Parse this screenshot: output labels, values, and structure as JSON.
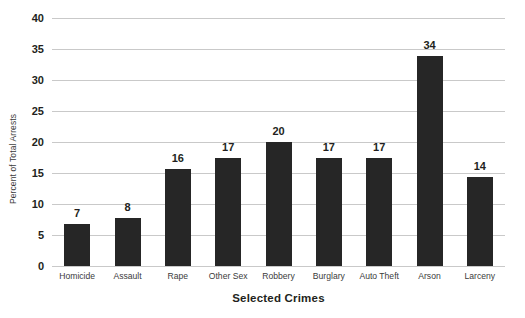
{
  "chart_data": {
    "type": "bar",
    "title": "",
    "xlabel": "Selected Crimes",
    "ylabel": "Percent of Total Arrests",
    "categories": [
      "Homicide",
      "Assault",
      "Rape",
      "Other Sex",
      "Robbery",
      "Burglary",
      "Auto Theft",
      "Arson",
      "Larceny"
    ],
    "values": [
      7,
      8,
      16,
      17,
      20,
      17,
      17,
      34,
      14
    ],
    "plotted_values": [
      6.7,
      7.8,
      15.6,
      17.4,
      20.0,
      17.4,
      17.4,
      33.8,
      14.3
    ],
    "ylim": [
      0,
      40
    ],
    "yticks": [
      0,
      5,
      10,
      15,
      20,
      25,
      30,
      35,
      40
    ],
    "ytick_labels": [
      "0",
      "5",
      "10",
      "15",
      "20",
      "25",
      "30",
      "35",
      "40"
    ],
    "grid": "horizontal",
    "legend": "none",
    "bar_color": "#262626",
    "gridline_color": "#c9c9c9",
    "background_color": "#ffffff",
    "data_labels": [
      "7",
      "8",
      "16",
      "17",
      "20",
      "17",
      "17",
      "34",
      "14"
    ]
  }
}
